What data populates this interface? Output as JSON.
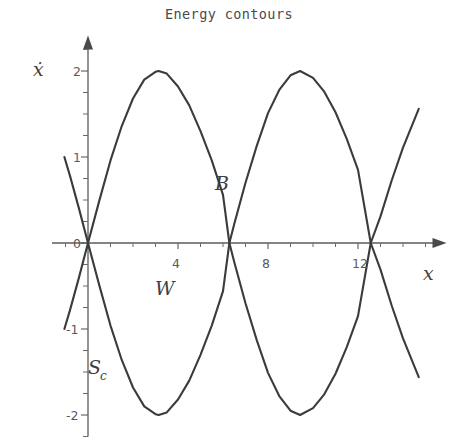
{
  "figure": {
    "title": "Energy contours",
    "background_color": "#ffffff",
    "ink_color": "#3b3b3b"
  },
  "axes": {
    "x_axis_label": "x",
    "y_axis_label": "ẋ",
    "x_tick_labels": [
      "0",
      "4",
      "8",
      "12"
    ],
    "x_tick_values": [
      0,
      4,
      8,
      12
    ],
    "y_tick_labels": [
      "2",
      "1",
      "0",
      "-1",
      "-2"
    ],
    "y_tick_values": [
      2,
      1,
      0,
      -1,
      -2
    ]
  },
  "annotations": {
    "b_label": "B",
    "w_label": "W",
    "s_label": "S",
    "s_subscript": "c"
  },
  "chart_data": {
    "type": "line",
    "title": "Energy contours",
    "xlabel": "x",
    "ylabel": "ẋ",
    "xlim": [
      -1.6,
      15.4
    ],
    "ylim": [
      -2.25,
      2.25
    ],
    "grid": false,
    "legend": null,
    "x_ticks": [
      0,
      4,
      8,
      12
    ],
    "y_ticks": [
      -2,
      -1,
      0,
      1,
      2
    ],
    "x_minor_tick_step": 1,
    "y_minor_tick_step": 0.25,
    "annotations": [
      {
        "text": "B",
        "x": 5.6,
        "y": 0.78
      },
      {
        "text": "W",
        "x": 3.3,
        "y": -0.48
      },
      {
        "text": "S_c",
        "x": 0.9,
        "y": -1.42
      }
    ],
    "series": [
      {
        "name": "upper separatrix",
        "formula": "xdot = 2*sin(x/2)",
        "x": [
          -1.05,
          -0.8,
          -0.4,
          0.0,
          0.5,
          1.0,
          1.5,
          2.0,
          2.5,
          3.0,
          3.1416,
          3.5,
          4.0,
          4.5,
          5.0,
          5.5,
          6.0,
          6.2832,
          6.5,
          7.0,
          7.5,
          8.0,
          8.5,
          9.0,
          9.4248,
          10.0,
          10.5,
          11.0,
          11.5,
          12.0,
          12.5664,
          13.0,
          13.5,
          14.0,
          14.7
        ],
        "values": [
          -1.0,
          -0.78,
          -0.4,
          0.0,
          0.49,
          0.96,
          1.36,
          1.68,
          1.9,
          1.99,
          2.0,
          1.97,
          1.82,
          1.6,
          1.3,
          0.96,
          0.56,
          0.0,
          -0.22,
          -0.7,
          -1.13,
          -1.51,
          -1.78,
          -1.95,
          -2.0,
          -1.92,
          -1.76,
          -1.52,
          -1.21,
          -0.85,
          0.0,
          0.31,
          0.73,
          1.11,
          1.56
        ]
      },
      {
        "name": "lower separatrix",
        "formula": "xdot = -2*sin(x/2)",
        "x": [
          -1.05,
          -0.8,
          -0.4,
          0.0,
          0.5,
          1.0,
          1.5,
          2.0,
          2.5,
          3.0,
          3.1416,
          3.5,
          4.0,
          4.5,
          5.0,
          5.5,
          6.0,
          6.2832,
          6.5,
          7.0,
          7.5,
          8.0,
          8.5,
          9.0,
          9.4248,
          10.0,
          10.5,
          11.0,
          11.5,
          12.0,
          12.5664,
          13.0,
          13.5,
          14.0,
          14.7
        ],
        "values": [
          1.0,
          0.78,
          0.4,
          0.0,
          -0.49,
          -0.96,
          -1.36,
          -1.68,
          -1.9,
          -1.99,
          -2.0,
          -1.97,
          -1.82,
          -1.6,
          -1.3,
          -0.96,
          -0.56,
          0.0,
          0.22,
          0.7,
          1.13,
          1.51,
          1.78,
          1.95,
          2.0,
          1.92,
          1.76,
          1.52,
          1.21,
          0.85,
          0.0,
          -0.31,
          -0.73,
          -1.11,
          -1.56
        ]
      }
    ]
  }
}
